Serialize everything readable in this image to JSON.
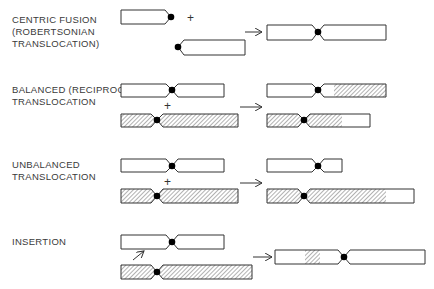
{
  "colors": {
    "outline": "#333333",
    "centromere": "#000000",
    "hatch": "#555555",
    "text": "#3a3a3a"
  },
  "sections": [
    {
      "id": "centric-fusion",
      "label": "CENTRIC FUSION\n(ROBERTSONIAN\nTRANSLOCATION)",
      "operator": "+",
      "arrow": "→"
    },
    {
      "id": "balanced",
      "label": "BALANCED (RECIPROCAL)\nTRANSLOCATION",
      "operator": "+",
      "arrow": "→"
    },
    {
      "id": "unbalanced",
      "label": "UNBALANCED\nTRANSLOCATION",
      "operator": "+",
      "arrow": "→"
    },
    {
      "id": "insertion",
      "label": "INSERTION",
      "operator": "↗",
      "arrow": "→"
    }
  ]
}
